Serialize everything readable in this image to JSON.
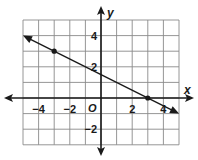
{
  "chart_data": {
    "type": "line",
    "title": "",
    "xlabel": "x",
    "ylabel": "y",
    "origin_label": "O",
    "xlim": [
      -5,
      5
    ],
    "ylim": [
      -3,
      5
    ],
    "grid": true,
    "x_tick_labels": [
      "-4",
      "-2",
      "2",
      "4"
    ],
    "y_tick_labels": [
      "4",
      "2",
      "-2"
    ],
    "line": {
      "slope": -0.5,
      "intercept": 1.5,
      "x_start": -5,
      "x_end": 5,
      "arrows": "both"
    },
    "points": [
      {
        "x": -3,
        "y": 3
      },
      {
        "x": 3,
        "y": 0
      }
    ]
  },
  "labels": {
    "x_axis": "x",
    "y_axis": "y",
    "origin": "O",
    "x_ticks": [
      {
        "label": "−4",
        "value": -4
      },
      {
        "label": "−2",
        "value": -2
      },
      {
        "label": "2",
        "value": 2
      },
      {
        "label": "4",
        "value": 4
      }
    ],
    "y_ticks": [
      {
        "label": "4",
        "value": 4
      },
      {
        "label": "2",
        "value": 2
      },
      {
        "label": "−2",
        "value": -2
      }
    ]
  },
  "colors": {
    "grid": "#7a7a7a",
    "axis": "#1a1a1a",
    "line": "#1a1a1a"
  }
}
